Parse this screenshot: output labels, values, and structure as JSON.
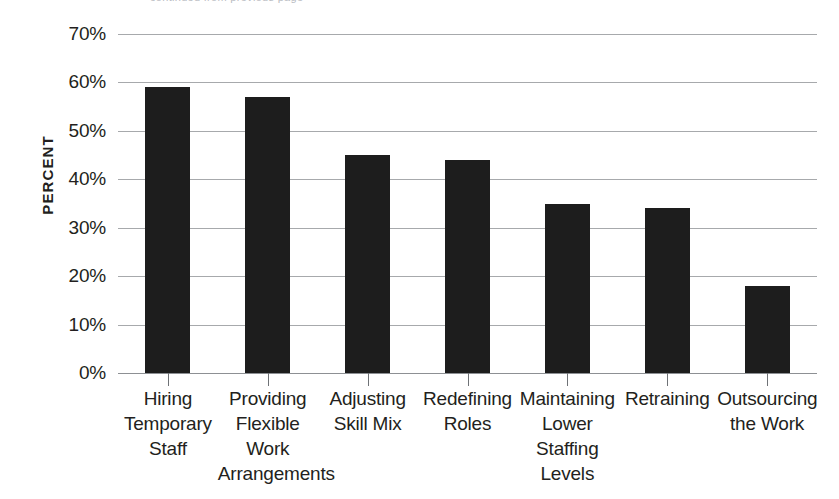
{
  "top_clipped_text": "continued from previous page",
  "chart_data": {
    "type": "bar",
    "title": "",
    "subtitle": "",
    "xlabel": "",
    "ylabel": "PERCENT",
    "categories": [
      "Hiring Temporary Staff",
      "Providing Flexible Work Arrangements",
      "Adjusting Skill Mix",
      "Redefining Roles",
      "Maintaining Lower Staffing Levels",
      "Retraining",
      "Outsourcing the Work"
    ],
    "category_lines": [
      [
        "Hiring",
        "Temporary",
        "Staff"
      ],
      [
        "Providing",
        "Flexible",
        "Work",
        "Arrangements"
      ],
      [
        "Adjusting",
        "Skill Mix"
      ],
      [
        "Redefining",
        "Roles"
      ],
      [
        "Maintaining",
        "Lower",
        "Staffing",
        "Levels"
      ],
      [
        "Retraining"
      ],
      [
        "Outsourcing",
        "the Work"
      ]
    ],
    "values": [
      59,
      57,
      45,
      44,
      35,
      34,
      18
    ],
    "ylim": [
      0,
      70
    ],
    "ytick_step": 10,
    "ytick_labels": [
      "70%",
      "60%",
      "50%",
      "40%",
      "30%",
      "20%",
      "10%",
      "0%"
    ],
    "ytick_values": [
      70,
      60,
      50,
      40,
      30,
      20,
      10,
      0
    ],
    "grid": true,
    "legend": false,
    "bar_color": "#1d1d1d",
    "grid_color": "#a7a9ac",
    "text_color": "#231f20"
  }
}
